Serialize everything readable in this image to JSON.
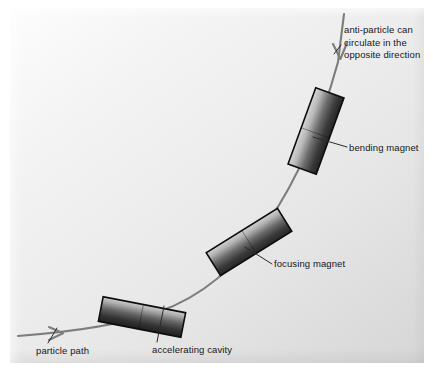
{
  "figure": {
    "kind": "schematic-diagram",
    "background_color": "#ededed",
    "page_color": "#ffffff",
    "ink_color": "#15161a",
    "path_color": "#7b7b7b"
  },
  "labels": {
    "antiparticle": "anti-particle can circulate in the opposite direction",
    "bending_magnet": "bending magnet",
    "focusing_magnet": "focusing magnet",
    "accelerating_cavity": "accelerating cavity",
    "particle_path": "particle path"
  },
  "components": [
    {
      "id": "bending-magnet",
      "label": "bending magnet",
      "shape": "rectangle",
      "center_x": 316,
      "center_y": 131,
      "width": 30,
      "height": 81,
      "rotation_deg": 20,
      "fill_dark": "#2a2a2a",
      "fill_light": "#d4d4d4",
      "stroke": "#101010"
    },
    {
      "id": "focusing-magnet",
      "label": "focusing magnet",
      "shape": "rectangle",
      "center_x": 249,
      "center_y": 242,
      "width": 27,
      "height": 84,
      "rotation_deg": 58,
      "fill_dark": "#2c2c2c",
      "fill_light": "#d0d0d0",
      "stroke": "#101010"
    },
    {
      "id": "accelerating-cavity",
      "label": "accelerating cavity",
      "shape": "rectangle",
      "center_x": 142,
      "center_y": 317,
      "width": 25,
      "height": 84,
      "rotation_deg": 101,
      "fill_dark": "#262626",
      "fill_light": "#cfcfcf",
      "stroke": "#101010"
    }
  ],
  "path": {
    "name": "particle path",
    "direction_particle": "rightward then upward along the curve",
    "direction_antiparticle": "downward, opposite direction",
    "arrow_particle": {
      "x": 60,
      "y": 333,
      "points": "right"
    },
    "arrow_antiparticle": {
      "x": 340,
      "y": 52,
      "points": "down"
    }
  },
  "leaders": [
    {
      "from": "anti-particle text",
      "to": "path top arrow"
    },
    {
      "from": "bending magnet text",
      "to": "bending magnet body"
    },
    {
      "from": "focusing magnet text",
      "to": "focusing magnet body"
    },
    {
      "from": "accelerating cavity text",
      "to": "accelerating cavity body"
    },
    {
      "from": "particle path text",
      "to": "path lower segment"
    }
  ]
}
